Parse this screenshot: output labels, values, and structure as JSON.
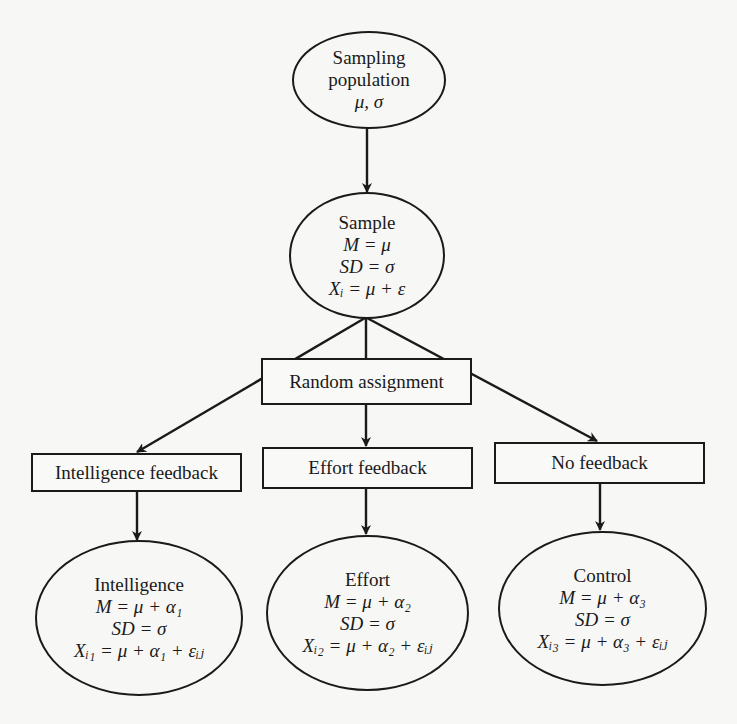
{
  "diagram": {
    "type": "flowchart",
    "nodes": {
      "population": {
        "shape": "ellipse",
        "lines": [
          "Sampling",
          "population",
          "μ, σ"
        ]
      },
      "sample": {
        "shape": "ellipse",
        "lines": [
          "Sample",
          "M = μ",
          "SD = σ",
          "Xᵢ = μ + ε"
        ]
      },
      "random_assignment": {
        "shape": "box",
        "label": "Random assignment"
      },
      "intelligence_feedback": {
        "shape": "box",
        "label": "Intelligence feedback"
      },
      "effort_feedback": {
        "shape": "box",
        "label": "Effort feedback"
      },
      "no_feedback": {
        "shape": "box",
        "label": "No feedback"
      },
      "intelligence": {
        "shape": "ellipse",
        "lines": [
          "Intelligence",
          "M = μ + α₁",
          "SD = σ",
          "Xᵢ₁ = μ + α₁ + εᵢⱼ"
        ]
      },
      "effort": {
        "shape": "ellipse",
        "lines": [
          "Effort",
          "M = μ + α₂",
          "SD = σ",
          "Xᵢ₂ = μ + α₂ + εᵢⱼ"
        ]
      },
      "control": {
        "shape": "ellipse",
        "lines": [
          "Control",
          "M = μ + α₃",
          "SD = σ",
          "Xᵢ₃ = μ + α₃ + εᵢⱼ"
        ]
      }
    },
    "edges": [
      {
        "from": "population",
        "to": "sample"
      },
      {
        "from": "sample",
        "to": "intelligence_feedback",
        "via": "random_assignment"
      },
      {
        "from": "sample",
        "to": "effort_feedback",
        "via": "random_assignment"
      },
      {
        "from": "sample",
        "to": "no_feedback",
        "via": "random_assignment"
      },
      {
        "from": "intelligence_feedback",
        "to": "intelligence"
      },
      {
        "from": "effort_feedback",
        "to": "effort"
      },
      {
        "from": "no_feedback",
        "to": "control"
      }
    ]
  }
}
